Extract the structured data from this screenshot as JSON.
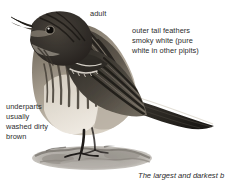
{
  "plate": {
    "subject": "pipit-illustration",
    "style": "greyscale-field-guide-painting",
    "colors": {
      "background": "#ffffff",
      "text": "#2b2b2b",
      "plumage_dark": "#3a3632",
      "plumage_mid": "#7d7468",
      "plumage_light": "#cfc7bb",
      "belly": "#e4ded4",
      "ground": "#9a958e",
      "leg": "#1f1c1a"
    }
  },
  "labels": {
    "adult": "adult",
    "outer_tail": "outer tail feathers\nsmoky white (pure\nwhite in other pipits)",
    "underparts": "underparts\nusually\nwashed dirty\nbrown"
  },
  "caption": {
    "text": "The largest and darkest b"
  }
}
